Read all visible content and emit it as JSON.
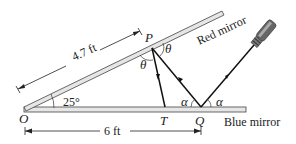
{
  "figure": {
    "labels": {
      "O": "O",
      "P": "P",
      "T": "T",
      "Q": "Q",
      "theta_left": "θ",
      "theta_right": "θ",
      "alpha_left": "α",
      "alpha_right": "α",
      "angle": "25°",
      "dist_OP": "4.7 ft",
      "dist_OQ": "6 ft",
      "red_mirror": "Red mirror",
      "blue_mirror": "Blue mirror"
    },
    "colors": {
      "line": "#222222",
      "mirror_fill": "#e6e6e6",
      "flashlight": "#555555"
    }
  }
}
